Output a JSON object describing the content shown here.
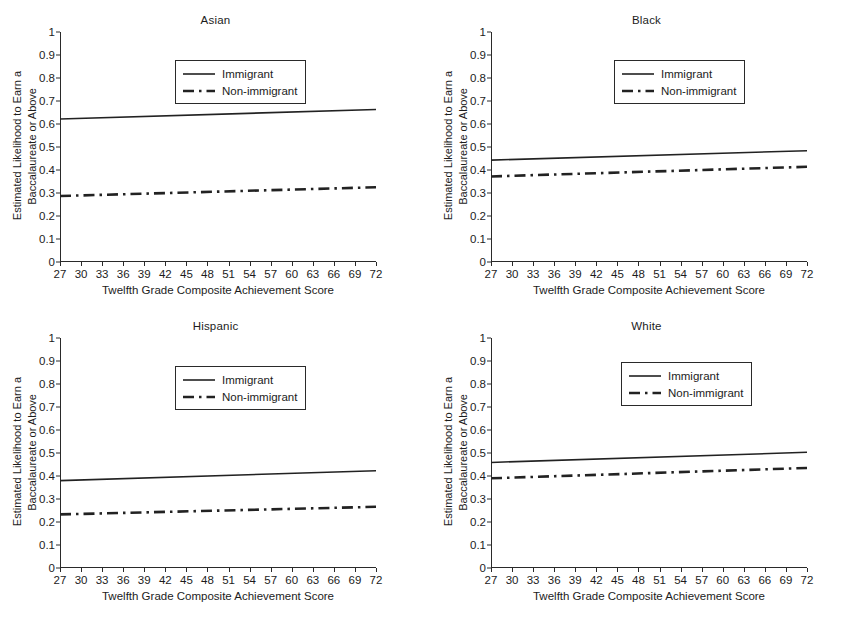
{
  "figure": {
    "background": "#ffffff",
    "line_color": "#222222",
    "axis_color": "#2a2a2a"
  },
  "common": {
    "xlabel": "Twelfth Grade Composite Achievement Score",
    "ylabel_line1": "Estimated Likelihood to Earn a",
    "ylabel_line2": "Baccalaureate or Above",
    "xticks": [
      "27",
      "30",
      "33",
      "36",
      "39",
      "42",
      "45",
      "48",
      "51",
      "54",
      "57",
      "60",
      "63",
      "66",
      "69",
      "72"
    ],
    "yticks": [
      "0",
      "0.1",
      "0.2",
      "0.3",
      "0.4",
      "0.5",
      "0.6",
      "0.7",
      "0.8",
      "0.9",
      "1"
    ],
    "legend": {
      "immigrant_label": "Immigrant",
      "nonimmigrant_label": "Non-immigrant"
    }
  },
  "panels": [
    {
      "id": "asian",
      "title": "Asian"
    },
    {
      "id": "black",
      "title": "Black"
    },
    {
      "id": "hispanic",
      "title": "Hispanic"
    },
    {
      "id": "white",
      "title": "White"
    }
  ],
  "chart_data": [
    {
      "type": "line",
      "title": "Asian",
      "xlabel": "Twelfth Grade Composite Achievement Score",
      "ylabel": "Estimated Likelihood to Earn a Baccalaureate or Above",
      "xlim": [
        27,
        72
      ],
      "ylim": [
        0,
        1
      ],
      "xticks": [
        27,
        30,
        33,
        36,
        39,
        42,
        45,
        48,
        51,
        54,
        57,
        60,
        63,
        66,
        69,
        72
      ],
      "yticks": [
        0,
        0.1,
        0.2,
        0.3,
        0.4,
        0.5,
        0.6,
        0.7,
        0.8,
        0.9,
        1
      ],
      "grid": false,
      "legend_position": "upper center",
      "series": [
        {
          "name": "Immigrant",
          "style": "solid",
          "x": [
            27,
            72
          ],
          "values": [
            0.622,
            0.663
          ]
        },
        {
          "name": "Non-immigrant",
          "style": "dash-dot",
          "x": [
            27,
            72
          ],
          "values": [
            0.287,
            0.325
          ]
        }
      ]
    },
    {
      "type": "line",
      "title": "Black",
      "xlabel": "Twelfth Grade Composite Achievement Score",
      "ylabel": "Estimated Likelihood to Earn a Baccalaureate or Above",
      "xlim": [
        27,
        72
      ],
      "ylim": [
        0,
        1
      ],
      "xticks": [
        27,
        30,
        33,
        36,
        39,
        42,
        45,
        48,
        51,
        54,
        57,
        60,
        63,
        66,
        69,
        72
      ],
      "yticks": [
        0,
        0.1,
        0.2,
        0.3,
        0.4,
        0.5,
        0.6,
        0.7,
        0.8,
        0.9,
        1
      ],
      "grid": false,
      "legend_position": "upper center",
      "series": [
        {
          "name": "Immigrant",
          "style": "solid",
          "x": [
            27,
            72
          ],
          "values": [
            0.443,
            0.484
          ]
        },
        {
          "name": "Non-immigrant",
          "style": "dash-dot",
          "x": [
            27,
            72
          ],
          "values": [
            0.372,
            0.414
          ]
        }
      ]
    },
    {
      "type": "line",
      "title": "Hispanic",
      "xlabel": "Twelfth Grade Composite Achievement Score",
      "ylabel": "Estimated Likelihood to Earn a Baccalaureate or Above",
      "xlim": [
        27,
        72
      ],
      "ylim": [
        0,
        1
      ],
      "xticks": [
        27,
        30,
        33,
        36,
        39,
        42,
        45,
        48,
        51,
        54,
        57,
        60,
        63,
        66,
        69,
        72
      ],
      "yticks": [
        0,
        0.1,
        0.2,
        0.3,
        0.4,
        0.5,
        0.6,
        0.7,
        0.8,
        0.9,
        1
      ],
      "grid": false,
      "legend_position": "upper center",
      "series": [
        {
          "name": "Immigrant",
          "style": "solid",
          "x": [
            27,
            72
          ],
          "values": [
            0.38,
            0.423
          ]
        },
        {
          "name": "Non-immigrant",
          "style": "dash-dot",
          "x": [
            27,
            72
          ],
          "values": [
            0.233,
            0.266
          ]
        }
      ]
    },
    {
      "type": "line",
      "title": "White",
      "xlabel": "Twelfth Grade Composite Achievement Score",
      "ylabel": "Estimated Likelihood to Earn a Baccalaureate or Above",
      "xlim": [
        27,
        72
      ],
      "ylim": [
        0,
        1
      ],
      "xticks": [
        27,
        30,
        33,
        36,
        39,
        42,
        45,
        48,
        51,
        54,
        57,
        60,
        63,
        66,
        69,
        72
      ],
      "yticks": [
        0,
        0.1,
        0.2,
        0.3,
        0.4,
        0.5,
        0.6,
        0.7,
        0.8,
        0.9,
        1
      ],
      "grid": false,
      "legend_position": "upper center",
      "series": [
        {
          "name": "Immigrant",
          "style": "solid",
          "x": [
            27,
            72
          ],
          "values": [
            0.459,
            0.503
          ]
        },
        {
          "name": "Non-immigrant",
          "style": "dash-dot",
          "x": [
            27,
            72
          ],
          "values": [
            0.39,
            0.435
          ]
        }
      ]
    }
  ]
}
